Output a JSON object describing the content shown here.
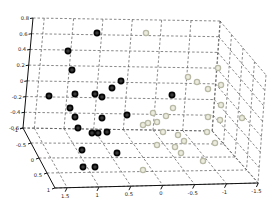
{
  "figure": {
    "background": "#ffffff",
    "grid_color": "#555555",
    "axis_color": "#111111",
    "label_color": "#222222"
  },
  "chart_data": {
    "type": "scatter",
    "projection": "3d",
    "title": "",
    "xlabel": "",
    "ylabel": "",
    "zlabel": "",
    "grid": true,
    "legend": false,
    "axes": {
      "x": {
        "ticks": [
          "1.5",
          "1",
          "0.5",
          "0",
          "-0.5",
          "-1",
          "-1.5"
        ],
        "range": [
          1.5,
          -1.5
        ]
      },
      "y": {
        "ticks": [
          "-1",
          "-0.5",
          "0",
          "0.5",
          "1"
        ],
        "range": [
          -1,
          1
        ]
      },
      "z": {
        "ticks": [
          "0.8",
          "0.6",
          "0.4",
          "0.2",
          "0",
          "-0.2",
          "-0.4",
          "-0.6"
        ],
        "range": [
          0.8,
          -0.6
        ]
      }
    },
    "series": [
      {
        "name": "class-dark",
        "marker": "circle",
        "edge_color": "#050505",
        "face_color": "#3a3a3a",
        "points_px": [
          [
            97,
            33
          ],
          [
            68,
            51
          ],
          [
            72,
            70
          ],
          [
            121,
            81
          ],
          [
            49,
            96
          ],
          [
            75,
            94
          ],
          [
            95,
            94
          ],
          [
            102,
            97
          ],
          [
            112,
            88
          ],
          [
            172,
            95
          ],
          [
            70,
            108
          ],
          [
            75,
            117
          ],
          [
            78,
            128
          ],
          [
            102,
            118
          ],
          [
            127,
            115
          ],
          [
            92,
            133
          ],
          [
            98,
            133
          ],
          [
            107,
            132
          ],
          [
            82,
            150
          ],
          [
            117,
            153
          ],
          [
            83,
            167
          ],
          [
            95,
            167
          ]
        ]
      },
      {
        "name": "class-light",
        "marker": "circle",
        "edge_color": "#b9b9a6",
        "face_color": "#ececdf",
        "points_px": [
          [
            146,
            33
          ],
          [
            188,
            77
          ],
          [
            197,
            82
          ],
          [
            208,
            89
          ],
          [
            218,
            68
          ],
          [
            221,
            85
          ],
          [
            221,
            105
          ],
          [
            208,
            117
          ],
          [
            220,
            120
          ],
          [
            207,
            132
          ],
          [
            215,
            143
          ],
          [
            242,
            118
          ],
          [
            153,
            113
          ],
          [
            173,
            108
          ],
          [
            143,
            125
          ],
          [
            148,
            123
          ],
          [
            157,
            122
          ],
          [
            166,
            116
          ],
          [
            163,
            132
          ],
          [
            178,
            135
          ],
          [
            157,
            145
          ],
          [
            175,
            147
          ],
          [
            184,
            141
          ],
          [
            143,
            170
          ],
          [
            203,
            161
          ],
          [
            181,
            153
          ]
        ]
      }
    ]
  }
}
